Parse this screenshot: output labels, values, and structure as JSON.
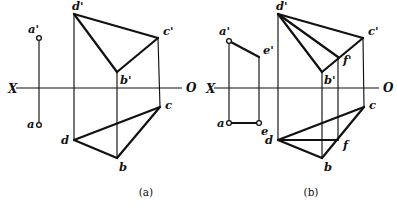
{
  "figure": {
    "background_color": "#ffffff",
    "stroke_color": "#111111",
    "width": 397,
    "height": 212,
    "captions": [
      {
        "id": "caption-a",
        "text": "(a)",
        "x": 146,
        "y": 196
      },
      {
        "id": "caption-b",
        "text": "(b)",
        "x": 311,
        "y": 196
      }
    ]
  },
  "panels": [
    {
      "id": "panel-a",
      "caption": "(a)",
      "axis": {
        "name": "projection-axis",
        "label_left": "X",
        "label_right": "O",
        "label_left_pos": {
          "x": 8,
          "y": 93
        },
        "label_right_pos": {
          "x": 186,
          "y": 92
        },
        "x1": 16,
        "y1": 88,
        "x2": 182,
        "y2": 88
      },
      "points": [
        {
          "label": "a'",
          "x": 39,
          "y": 38,
          "marker": "circle",
          "label_dx": -11,
          "label_dy": -5
        },
        {
          "label": "a",
          "x": 39,
          "y": 125,
          "marker": "circle",
          "label_dx": -12,
          "label_dy": 3
        },
        {
          "label": "d'",
          "x": 74,
          "y": 14,
          "marker": "none",
          "label_dx": -2,
          "label_dy": -4
        },
        {
          "label": "c'",
          "x": 158,
          "y": 38,
          "marker": "none",
          "label_dx": 5,
          "label_dy": -3
        },
        {
          "label": "b'",
          "x": 117,
          "y": 72,
          "marker": "none",
          "label_dx": 3,
          "label_dy": 12
        },
        {
          "label": "d",
          "x": 74,
          "y": 140,
          "marker": "none",
          "label_dx": -13,
          "label_dy": 4
        },
        {
          "label": "c",
          "x": 160,
          "y": 107,
          "marker": "none",
          "label_dx": 5,
          "label_dy": 2
        },
        {
          "label": "b",
          "x": 117,
          "y": 158,
          "marker": "none",
          "label_dx": 2,
          "label_dy": 13
        }
      ],
      "edges": {
        "thin_vertical_connectors": [
          {
            "name": "connector-a",
            "x1": 39,
            "y1": 41,
            "x2": 39,
            "y2": 122
          },
          {
            "name": "connector-d",
            "x1": 74,
            "y1": 14,
            "x2": 74,
            "y2": 140
          },
          {
            "name": "connector-b",
            "x1": 117,
            "y1": 72,
            "x2": 117,
            "y2": 158
          },
          {
            "name": "connector-c",
            "x1": 158,
            "y1": 38,
            "x2": 160,
            "y2": 107
          }
        ],
        "front_view_thick": [
          {
            "name": "edge-dc-front",
            "x1": 74,
            "y1": 14,
            "x2": 158,
            "y2": 38
          },
          {
            "name": "edge-db-front",
            "x1": 74,
            "y1": 14,
            "x2": 117,
            "y2": 72
          },
          {
            "name": "edge-bc-front",
            "x1": 117,
            "y1": 72,
            "x2": 158,
            "y2": 38
          }
        ],
        "top_view_thick": [
          {
            "name": "edge-dc-top",
            "x1": 74,
            "y1": 140,
            "x2": 160,
            "y2": 107
          },
          {
            "name": "edge-db-top",
            "x1": 74,
            "y1": 140,
            "x2": 117,
            "y2": 158
          },
          {
            "name": "edge-bc-top",
            "x1": 117,
            "y1": 158,
            "x2": 160,
            "y2": 107
          }
        ]
      }
    },
    {
      "id": "panel-b",
      "caption": "(b)",
      "axis": {
        "name": "projection-axis",
        "label_left": "X",
        "label_right": "O",
        "label_left_pos": {
          "x": 206,
          "y": 93
        },
        "label_right_pos": {
          "x": 383,
          "y": 92
        },
        "x1": 214,
        "y1": 88,
        "x2": 379,
        "y2": 88
      },
      "points": [
        {
          "label": "a'",
          "x": 229,
          "y": 41,
          "marker": "circle",
          "label_dx": -10,
          "label_dy": -6
        },
        {
          "label": "e'",
          "x": 259,
          "y": 57,
          "marker": "none",
          "label_dx": 4,
          "label_dy": -3
        },
        {
          "label": "a",
          "x": 229,
          "y": 123,
          "marker": "circle",
          "label_dx": -12,
          "label_dy": 4
        },
        {
          "label": "e",
          "x": 259,
          "y": 123,
          "marker": "circle",
          "label_dx": 2,
          "label_dy": 12
        },
        {
          "label": "d'",
          "x": 278,
          "y": 14,
          "marker": "none",
          "label_dx": -2,
          "label_dy": -4
        },
        {
          "label": "c'",
          "x": 363,
          "y": 38,
          "marker": "none",
          "label_dx": 5,
          "label_dy": -3
        },
        {
          "label": "f'",
          "x": 338,
          "y": 57,
          "marker": "none",
          "label_dx": 5,
          "label_dy": 7
        },
        {
          "label": "b'",
          "x": 322,
          "y": 72,
          "marker": "none",
          "label_dx": 2,
          "label_dy": 12
        },
        {
          "label": "d",
          "x": 278,
          "y": 140,
          "marker": "none",
          "label_dx": -13,
          "label_dy": 4
        },
        {
          "label": "c",
          "x": 364,
          "y": 107,
          "marker": "none",
          "label_dx": 5,
          "label_dy": 2
        },
        {
          "label": "f",
          "x": 338,
          "y": 140,
          "marker": "none",
          "label_dx": 5,
          "label_dy": 9
        },
        {
          "label": "b",
          "x": 322,
          "y": 158,
          "marker": "none",
          "label_dx": 2,
          "label_dy": 13
        }
      ],
      "edges": {
        "thin_vertical_connectors": [
          {
            "name": "connector-a",
            "x1": 229,
            "y1": 44,
            "x2": 229,
            "y2": 120
          },
          {
            "name": "connector-e",
            "x1": 259,
            "y1": 57,
            "x2": 259,
            "y2": 120
          },
          {
            "name": "connector-d",
            "x1": 278,
            "y1": 14,
            "x2": 278,
            "y2": 140
          },
          {
            "name": "connector-b",
            "x1": 322,
            "y1": 72,
            "x2": 322,
            "y2": 158
          },
          {
            "name": "connector-f",
            "x1": 338,
            "y1": 57,
            "x2": 338,
            "y2": 140
          },
          {
            "name": "connector-c",
            "x1": 363,
            "y1": 38,
            "x2": 364,
            "y2": 107
          }
        ],
        "segment_thick": [
          {
            "name": "edge-ae-front",
            "x1": 229,
            "y1": 41,
            "x2": 259,
            "y2": 57
          },
          {
            "name": "edge-ae-top",
            "x1": 229,
            "y1": 123,
            "x2": 259,
            "y2": 123
          }
        ],
        "front_view_thick": [
          {
            "name": "edge-dc-front",
            "x1": 278,
            "y1": 14,
            "x2": 363,
            "y2": 38
          },
          {
            "name": "edge-db-front",
            "x1": 278,
            "y1": 14,
            "x2": 322,
            "y2": 72
          },
          {
            "name": "edge-df-front",
            "x1": 278,
            "y1": 14,
            "x2": 338,
            "y2": 57
          },
          {
            "name": "edge-bc-front",
            "x1": 322,
            "y1": 72,
            "x2": 363,
            "y2": 38
          }
        ],
        "top_view_thick": [
          {
            "name": "edge-dc-top",
            "x1": 278,
            "y1": 140,
            "x2": 364,
            "y2": 107
          },
          {
            "name": "edge-db-top",
            "x1": 278,
            "y1": 140,
            "x2": 322,
            "y2": 158
          },
          {
            "name": "edge-df-top",
            "x1": 278,
            "y1": 140,
            "x2": 338,
            "y2": 140
          },
          {
            "name": "edge-bc-top",
            "x1": 322,
            "y1": 158,
            "x2": 364,
            "y2": 107
          }
        ]
      }
    }
  ]
}
